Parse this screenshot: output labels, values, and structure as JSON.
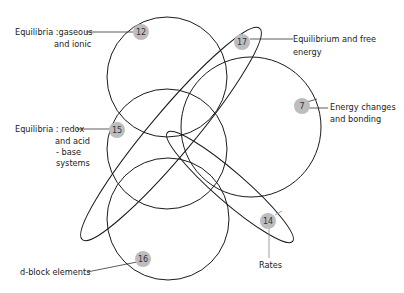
{
  "diagram": {
    "type": "overlapping-set-diagram",
    "stroke_color": "#1a1a1a",
    "badge_color": "#bdbdbd",
    "shapes": [
      {
        "id": "12",
        "kind": "circle",
        "cx": 167,
        "cy": 77,
        "r": 60
      },
      {
        "id": "15",
        "kind": "circle",
        "cx": 167,
        "cy": 149,
        "r": 60
      },
      {
        "id": "16",
        "kind": "circle",
        "cx": 168,
        "cy": 219,
        "r": 61
      },
      {
        "id": "7",
        "kind": "circle",
        "cx": 251,
        "cy": 127,
        "r": 70
      },
      {
        "id": "17",
        "kind": "ellipse",
        "cx": 171,
        "cy": 134,
        "rx": 138,
        "ry": 22,
        "angle": -50
      },
      {
        "id": "14",
        "kind": "ellipse",
        "cx": 230,
        "cy": 187,
        "rx": 83,
        "ry": 15,
        "angle": 41
      }
    ],
    "nodes": [
      {
        "number": "12",
        "label_lines": [
          "Equilibria :gaseous",
          "and ionic"
        ]
      },
      {
        "number": "17",
        "label_lines": [
          "Equilibrium and free",
          "energy"
        ]
      },
      {
        "number": "7",
        "label_lines": [
          "Energy changes",
          "and bonding"
        ]
      },
      {
        "number": "15",
        "label_lines": [
          "Equilibria : redox",
          "and acid",
          "- base",
          "systems"
        ]
      },
      {
        "number": "14",
        "label_lines": [
          "Rates"
        ]
      },
      {
        "number": "16",
        "label_lines": [
          "d-block elements"
        ]
      }
    ]
  }
}
